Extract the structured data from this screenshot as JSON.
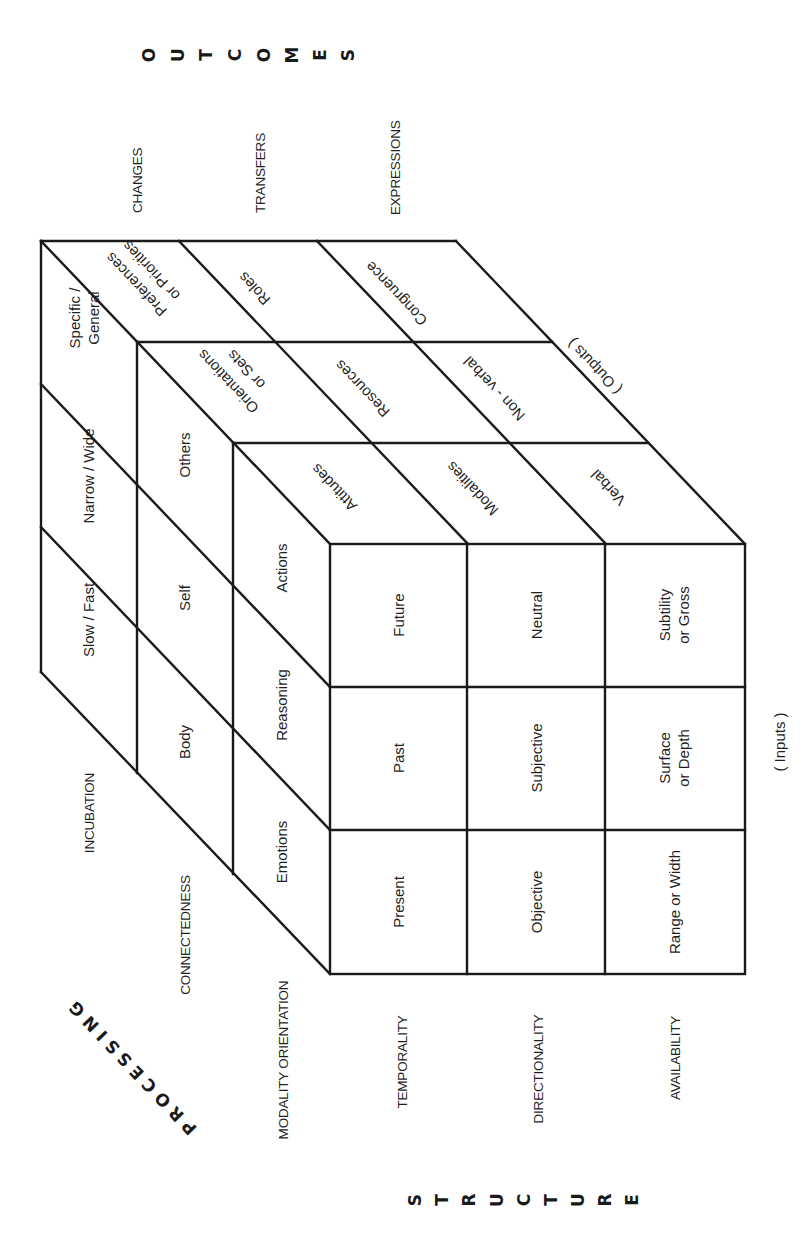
{
  "axes": {
    "outcomes": {
      "title": "OUTCOMES",
      "letters": [
        "O",
        "U",
        "T",
        "C",
        "O",
        "M",
        "E",
        "S"
      ],
      "labels": [
        "CHANGES",
        "TRANSFERS",
        "EXPRESSIONS"
      ],
      "annotation": "( Outputs )"
    },
    "processing": {
      "title": "PROCESSING",
      "labels": [
        "INCUBATION",
        "CONNECTEDNESS",
        "MODALITY ORIENTATION"
      ]
    },
    "structure": {
      "title": "STRUCTURE",
      "letters": [
        "S",
        "T",
        "R",
        "U",
        "C",
        "T",
        "U",
        "R",
        "E"
      ],
      "labels": [
        "TEMPORALITY",
        "DIRECTIONALITY",
        "AVAILABILITY"
      ],
      "annotation": "( Inputs )"
    }
  },
  "faces": {
    "front": {
      "rows": [
        [
          "Future",
          "Neutral",
          [
            "Subtility",
            "or Gross"
          ]
        ],
        [
          "Past",
          "Subjective",
          [
            "Surface",
            "or Depth"
          ]
        ],
        [
          "Present",
          "Objective",
          "Range or Width"
        ]
      ]
    },
    "side": {
      "layers": [
        [
          "Specific /",
          "General"
        ],
        "Narrow / Wide",
        "Slow / Fast",
        "Others",
        "Self",
        "Body",
        "Actions",
        "Reasoning",
        "Emotions"
      ]
    },
    "top": {
      "cells": [
        [
          "Preferences",
          "or Priorities"
        ],
        "Roles",
        "Congruence",
        [
          "Orientations",
          "or Sets"
        ],
        "Resources",
        "Non - verbal",
        "Attitudes",
        "Modalities",
        "Verbal"
      ]
    }
  },
  "colors": {
    "ink": "#1a1a1a",
    "background": "#ffffff"
  }
}
